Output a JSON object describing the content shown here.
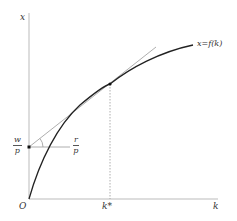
{
  "diagram": {
    "axes": {
      "y_label": "x",
      "x_label": "k",
      "origin_label": "O"
    },
    "curve": {
      "label": "x=f(k)",
      "description": "concave production function"
    },
    "tangent_point": {
      "x_tick_label": "k*"
    },
    "intercept": {
      "numerator": "w",
      "denominator": "p"
    },
    "slope": {
      "numerator": "r",
      "denominator": "p"
    },
    "colors": {
      "axis": "#bbbbbb",
      "curve": "#222222",
      "tangent": "#999999",
      "dashed": "#999999"
    }
  }
}
